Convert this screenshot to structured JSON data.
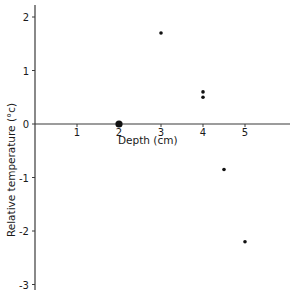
{
  "chart_data": {
    "type": "scatter",
    "title": "",
    "xlabel": "Depth (cm)",
    "ylabel": "Relative temperature (°c)",
    "xlim": [
      0,
      6
    ],
    "ylim": [
      -3,
      2.2
    ],
    "x_ticks": [
      1,
      2,
      3,
      4,
      5
    ],
    "x_tick_labels": [
      "1",
      "2",
      "3",
      "4",
      "5"
    ],
    "y_ticks": [
      2,
      1,
      0,
      -1,
      -2,
      -3
    ],
    "y_tick_labels": [
      "2",
      "1",
      "0",
      "-1",
      "-2",
      "-3"
    ],
    "grid": false,
    "legend": null,
    "series": [
      {
        "name": "Relative temperature",
        "points": [
          {
            "x": 2,
            "y": 0,
            "size": "large"
          },
          {
            "x": 3,
            "y": 1.7,
            "size": "small"
          },
          {
            "x": 4,
            "y": 0.6,
            "size": "small"
          },
          {
            "x": 4,
            "y": 0.5,
            "size": "small"
          },
          {
            "x": 4.5,
            "y": -0.85,
            "size": "small"
          },
          {
            "x": 5,
            "y": -2.2,
            "size": "small"
          }
        ]
      }
    ]
  }
}
